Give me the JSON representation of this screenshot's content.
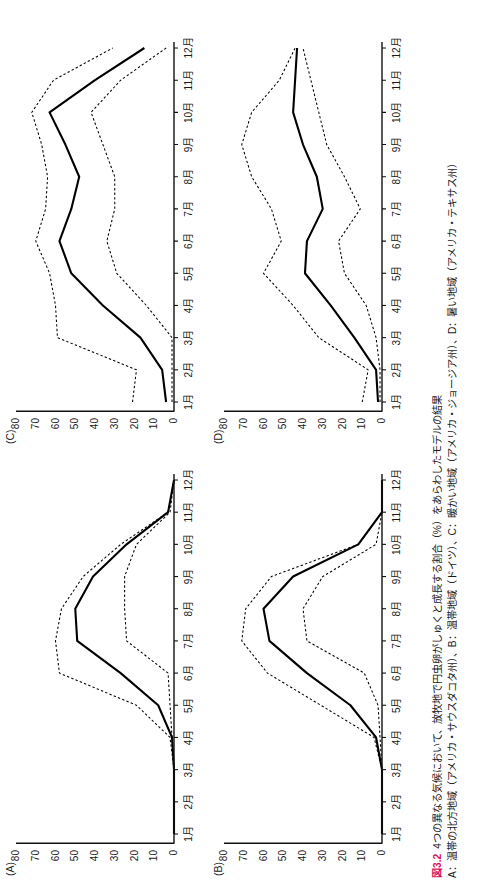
{
  "figure": {
    "number_label": "図3.2",
    "caption_line1": "4つの異なる気候において、放牧地で円虫卵がしゅくと成長する割合（%）をあらわしたモデルの結果",
    "caption_line2": "A：温帯の北方地域（アメリカ・サウスダコタ州）、B：温帯地域（ドイツ）、C：暖かい地域（アメリカ・ジョージア州）、D：暑い地域（アメリカ・テキサス州）",
    "accent_color": "#d4145a",
    "line_color": "#000000"
  },
  "axes": {
    "y_ticks": [
      "80",
      "70",
      "60",
      "50",
      "40",
      "30",
      "20",
      "10",
      "0"
    ],
    "x_ticks": [
      "1月",
      "2月",
      "3月",
      "4月",
      "5月",
      "6月",
      "7月",
      "8月",
      "9月",
      "10月",
      "11月",
      "12月"
    ],
    "ylim": [
      0,
      80
    ],
    "ylabel": "",
    "xlabel": ""
  },
  "panels": [
    {
      "key": "A",
      "label": "(A)"
    },
    {
      "key": "B",
      "label": "(B)"
    },
    {
      "key": "C",
      "label": "(C)"
    },
    {
      "key": "D",
      "label": "(D)"
    }
  ],
  "chart_data": [
    {
      "type": "line",
      "panel": "(A)",
      "title": "A：温帯の北方地域（アメリカ・サウスダコタ州）",
      "xlabel": "",
      "ylabel": "",
      "ylim": [
        0,
        80
      ],
      "grid": false,
      "legend": "none",
      "categories": [
        "1月",
        "2月",
        "3月",
        "4月",
        "5月",
        "6月",
        "7月",
        "8月",
        "9月",
        "10月",
        "11月",
        "12月"
      ],
      "series": [
        {
          "name": "mean",
          "style": "solid",
          "values": [
            0,
            0,
            0,
            1,
            8,
            27,
            49,
            50,
            41,
            24,
            3,
            0
          ]
        },
        {
          "name": "upper",
          "style": "dotted",
          "values": [
            0,
            0,
            0,
            2,
            19,
            58,
            60,
            57,
            46,
            27,
            3,
            0
          ]
        },
        {
          "name": "lower",
          "style": "dotted",
          "values": [
            0,
            0,
            0,
            1,
            2,
            3,
            24,
            25,
            25,
            19,
            2,
            0
          ]
        }
      ]
    },
    {
      "type": "line",
      "panel": "(B)",
      "title": "B：温帯地域（ドイツ）",
      "xlabel": "",
      "ylabel": "",
      "ylim": [
        0,
        80
      ],
      "grid": false,
      "legend": "none",
      "categories": [
        "1月",
        "2月",
        "3月",
        "4月",
        "5月",
        "6月",
        "7月",
        "8月",
        "9月",
        "10月",
        "11月",
        "12月"
      ],
      "series": [
        {
          "name": "mean",
          "style": "solid",
          "values": [
            0,
            0,
            0,
            3,
            16,
            38,
            57,
            60,
            45,
            12,
            0,
            0
          ]
        },
        {
          "name": "upper",
          "style": "dotted",
          "values": [
            0,
            0,
            0,
            4,
            31,
            58,
            71,
            69,
            56,
            12,
            0,
            0
          ]
        },
        {
          "name": "lower",
          "style": "dotted",
          "values": [
            0,
            0,
            0,
            1,
            2,
            9,
            38,
            40,
            30,
            3,
            0,
            0
          ]
        }
      ]
    },
    {
      "type": "line",
      "panel": "(C)",
      "title": "C：暖かい地域（アメリカ・ジョージア州）",
      "xlabel": "",
      "ylabel": "",
      "ylim": [
        0,
        80
      ],
      "grid": false,
      "legend": "none",
      "categories": [
        "1月",
        "2月",
        "3月",
        "4月",
        "5月",
        "6月",
        "7月",
        "8月",
        "9月",
        "10月",
        "11月",
        "12月"
      ],
      "series": [
        {
          "name": "mean",
          "style": "solid",
          "values": [
            4,
            6,
            17,
            36,
            52,
            58,
            52,
            48,
            55,
            63,
            40,
            15
          ]
        },
        {
          "name": "upper",
          "style": "dotted",
          "values": [
            21,
            19,
            59,
            60,
            63,
            70,
            65,
            64,
            67,
            72,
            61,
            31
          ]
        },
        {
          "name": "lower",
          "style": "dotted",
          "values": [
            1,
            1,
            1,
            14,
            29,
            34,
            30,
            30,
            36,
            42,
            27,
            4
          ]
        }
      ]
    },
    {
      "type": "line",
      "panel": "(D)",
      "title": "D：暑い地域（アメリカ・テキサス州）",
      "xlabel": "",
      "ylabel": "",
      "ylim": [
        0,
        80
      ],
      "grid": false,
      "legend": "none",
      "categories": [
        "1月",
        "2月",
        "3月",
        "4月",
        "5月",
        "6月",
        "7月",
        "8月",
        "9月",
        "10月",
        "11月",
        "12月"
      ],
      "series": [
        {
          "name": "mean",
          "style": "solid",
          "values": [
            2,
            3,
            14,
            26,
            39,
            38,
            30,
            33,
            40,
            45,
            44,
            43
          ]
        },
        {
          "name": "upper",
          "style": "dotted",
          "values": [
            10,
            7,
            32,
            45,
            60,
            51,
            56,
            66,
            71,
            66,
            52,
            44
          ]
        },
        {
          "name": "lower",
          "style": "dotted",
          "values": [
            1,
            1,
            3,
            8,
            19,
            22,
            11,
            19,
            28,
            32,
            36,
            40
          ]
        }
      ]
    }
  ]
}
